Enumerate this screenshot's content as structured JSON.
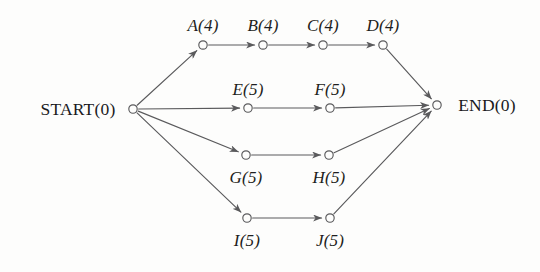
{
  "figure": {
    "type": "activity-on-edge-network",
    "background_color": "#fdfdfc",
    "line_color": "#5a5a5c",
    "text_color": "#1e1e20"
  },
  "nodes": [
    {
      "id": "START",
      "label": "START(0)",
      "name": "START",
      "duration": 0,
      "cx": 133,
      "cy": 109,
      "label_x": 78,
      "label_y": 109,
      "label_style": "terminal"
    },
    {
      "id": "A",
      "label": "A(4)",
      "name": "A",
      "duration": 4,
      "cx": 203,
      "cy": 45,
      "label_x": 203,
      "label_y": 26,
      "label_style": "node"
    },
    {
      "id": "B",
      "label": "B(4)",
      "name": "B",
      "duration": 4,
      "cx": 263,
      "cy": 45,
      "label_x": 263,
      "label_y": 26,
      "label_style": "node"
    },
    {
      "id": "C",
      "label": "C(4)",
      "name": "C",
      "duration": 4,
      "cx": 323,
      "cy": 45,
      "label_x": 323,
      "label_y": 26,
      "label_style": "node"
    },
    {
      "id": "D",
      "label": "D(4)",
      "name": "D",
      "duration": 4,
      "cx": 383,
      "cy": 45,
      "label_x": 383,
      "label_y": 26,
      "label_style": "node"
    },
    {
      "id": "E",
      "label": "E(5)",
      "name": "E",
      "duration": 5,
      "cx": 248,
      "cy": 108,
      "label_x": 248,
      "label_y": 90,
      "label_style": "node"
    },
    {
      "id": "F",
      "label": "F(5)",
      "name": "F",
      "duration": 5,
      "cx": 330,
      "cy": 108,
      "label_x": 330,
      "label_y": 90,
      "label_style": "node"
    },
    {
      "id": "G",
      "label": "G(5)",
      "name": "G",
      "duration": 5,
      "cx": 246,
      "cy": 155,
      "label_x": 246,
      "label_y": 178,
      "label_style": "node"
    },
    {
      "id": "H",
      "label": "H(5)",
      "name": "H",
      "duration": 5,
      "cx": 329,
      "cy": 155,
      "label_x": 329,
      "label_y": 178,
      "label_style": "node"
    },
    {
      "id": "I",
      "label": "I(5)",
      "name": "I",
      "duration": 5,
      "cx": 247,
      "cy": 218,
      "label_x": 247,
      "label_y": 241,
      "label_style": "node"
    },
    {
      "id": "J",
      "label": "J(5)",
      "name": "J",
      "duration": 5,
      "cx": 330,
      "cy": 218,
      "label_x": 330,
      "label_y": 241,
      "label_style": "node"
    },
    {
      "id": "END",
      "label": "END(0)",
      "name": "END",
      "duration": 0,
      "cx": 437,
      "cy": 105,
      "label_x": 487,
      "label_y": 105,
      "label_style": "terminal"
    }
  ],
  "edges": [
    {
      "from": "START",
      "to": "A",
      "name": "edge-start-a"
    },
    {
      "from": "A",
      "to": "B",
      "name": "edge-a-b"
    },
    {
      "from": "B",
      "to": "C",
      "name": "edge-b-c"
    },
    {
      "from": "C",
      "to": "D",
      "name": "edge-c-d"
    },
    {
      "from": "D",
      "to": "END",
      "name": "edge-d-end"
    },
    {
      "from": "START",
      "to": "E",
      "name": "edge-start-e"
    },
    {
      "from": "E",
      "to": "F",
      "name": "edge-e-f"
    },
    {
      "from": "F",
      "to": "END",
      "name": "edge-f-end"
    },
    {
      "from": "START",
      "to": "G",
      "name": "edge-start-g"
    },
    {
      "from": "G",
      "to": "H",
      "name": "edge-g-h"
    },
    {
      "from": "H",
      "to": "END",
      "name": "edge-h-end"
    },
    {
      "from": "START",
      "to": "I",
      "name": "edge-start-i"
    },
    {
      "from": "I",
      "to": "J",
      "name": "edge-i-j"
    },
    {
      "from": "J",
      "to": "END",
      "name": "edge-j-end"
    }
  ]
}
